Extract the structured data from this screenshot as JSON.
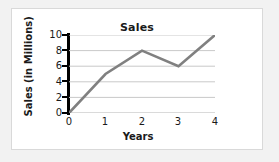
{
  "chart_data": {
    "type": "line",
    "title": "Sales",
    "xlabel": "Years",
    "ylabel": "Sales (in Millions)",
    "x": [
      0,
      1,
      2,
      3,
      4
    ],
    "values": [
      0,
      5,
      8,
      6,
      10
    ],
    "xtick_labels": [
      "0",
      "1",
      "2",
      "3",
      "4"
    ],
    "ytick_labels": [
      "0",
      "2",
      "4",
      "6",
      "8",
      "10"
    ],
    "yticks": [
      0,
      2,
      4,
      6,
      8,
      10
    ],
    "xlim": [
      0,
      4
    ],
    "ylim": [
      0,
      10
    ],
    "grid": "horizontal",
    "legend": "none",
    "series_color": "#808080",
    "axis_color": "#000000",
    "gridline_color": "#c9c9c9"
  }
}
